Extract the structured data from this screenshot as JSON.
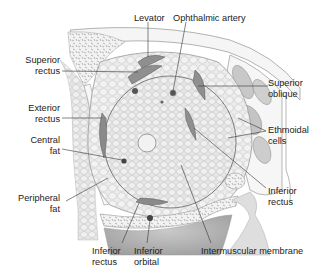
{
  "diagram": {
    "labels": {
      "levator": "Levator",
      "ophthalmic_artery": "Ophthalmic artery",
      "superior_rectus_1": "Superior",
      "superior_rectus_2": "rectus",
      "superior_oblique_1": "Superior",
      "superior_oblique_2": "oblique",
      "exterior_rectus_1": "Exterior",
      "exterior_rectus_2": "rectus",
      "ethmoidal_cells_1": "Ethmoidal",
      "ethmoidal_cells_2": "cells",
      "central_fat_1": "Central",
      "central_fat_2": "fat",
      "inferior_rectus_right_1": "Inferior",
      "inferior_rectus_right_2": "rectus",
      "peripheral_fat_1": "Peripheral",
      "peripheral_fat_2": "fat",
      "inferior_rectus_bottom_1": "Inferior",
      "inferior_rectus_bottom_2": "rectus",
      "inferior_orbital_1": "Inferior",
      "inferior_orbital_2": "orbital",
      "intermuscular_membrane": "Intermuscular membrane"
    },
    "colors": {
      "fat": "#e9e9e9",
      "fat_cell_stroke": "#c9c9c9",
      "muscle": "#8e8e8e",
      "bone": "#f4f4f4",
      "bone_stroke": "#9a9a9a",
      "shadow": "#b5b5b5",
      "leader_line": "#333333",
      "text": "#222222"
    }
  }
}
